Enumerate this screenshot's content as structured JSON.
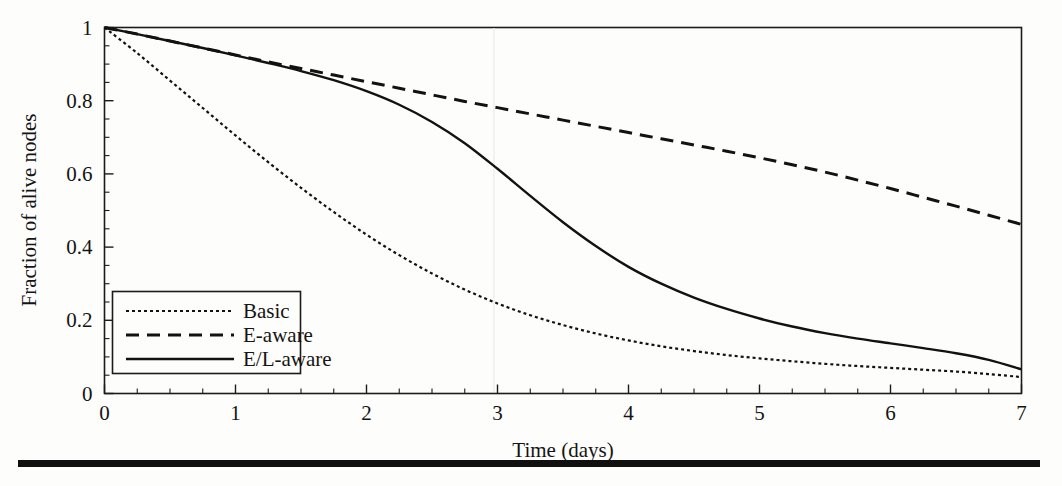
{
  "figure": {
    "name": "fraction-of-alive-nodes-over-time",
    "background_color": "#fdfdfb",
    "ink_color": "#121212"
  },
  "chart_data": {
    "type": "line",
    "title": "",
    "subtitle": "",
    "xlabel": "Time (days)",
    "ylabel": "Fraction of alive nodes",
    "xlim": [
      0,
      7
    ],
    "ylim": [
      0,
      1
    ],
    "x_major_ticks": [
      0,
      1,
      2,
      3,
      4,
      5,
      6,
      7
    ],
    "x_tick_labels": [
      "0",
      "1",
      "2",
      "3",
      "4",
      "5",
      "6",
      "7"
    ],
    "x_minor_step": 0.25,
    "y_major_ticks": [
      0,
      0.2,
      0.4,
      0.6,
      0.8,
      1
    ],
    "y_tick_labels": [
      "0",
      "0.2",
      "0.4",
      "0.6",
      "0.8",
      "1"
    ],
    "y_minor_step": 0.05,
    "grid": false,
    "legend_position": "lower-left",
    "annotations": [],
    "x": [
      0,
      0.25,
      0.5,
      0.75,
      1,
      1.25,
      1.5,
      1.75,
      2,
      2.25,
      2.5,
      2.75,
      3,
      3.25,
      3.5,
      3.75,
      4,
      4.25,
      4.5,
      4.75,
      5,
      5.25,
      5.5,
      5.75,
      6,
      6.25,
      6.5,
      6.75,
      7
    ],
    "series": [
      {
        "name": "Basic",
        "style": "dotted",
        "dash_pattern": "3,3",
        "line_width": 2.2,
        "color": "#121212",
        "values": [
          1.0,
          0.93,
          0.855,
          0.78,
          0.705,
          0.632,
          0.562,
          0.496,
          0.434,
          0.378,
          0.328,
          0.284,
          0.246,
          0.214,
          0.187,
          0.164,
          0.145,
          0.129,
          0.116,
          0.105,
          0.096,
          0.088,
          0.081,
          0.075,
          0.07,
          0.065,
          0.06,
          0.053,
          0.045
        ]
      },
      {
        "name": "E-aware",
        "style": "dashed",
        "dash_pattern": "13,8",
        "line_width": 3.0,
        "color": "#121212",
        "values": [
          1.0,
          0.982,
          0.963,
          0.944,
          0.925,
          0.906,
          0.888,
          0.87,
          0.852,
          0.834,
          0.816,
          0.798,
          0.781,
          0.764,
          0.747,
          0.73,
          0.713,
          0.696,
          0.679,
          0.662,
          0.644,
          0.625,
          0.605,
          0.583,
          0.56,
          0.536,
          0.512,
          0.487,
          0.462
        ]
      },
      {
        "name": "E/L-aware",
        "style": "solid",
        "dash_pattern": "none",
        "line_width": 2.4,
        "color": "#121212",
        "values": [
          1.0,
          0.982,
          0.963,
          0.944,
          0.924,
          0.903,
          0.881,
          0.856,
          0.826,
          0.789,
          0.742,
          0.684,
          0.614,
          0.54,
          0.468,
          0.403,
          0.346,
          0.3,
          0.262,
          0.231,
          0.205,
          0.183,
          0.165,
          0.15,
          0.137,
          0.124,
          0.11,
          0.092,
          0.066
        ]
      }
    ]
  },
  "legend": {
    "entries": [
      {
        "label": "Basic",
        "style": "dotted"
      },
      {
        "label": "E-aware",
        "style": "dashed"
      },
      {
        "label": "E/L-aware",
        "style": "solid"
      }
    ]
  }
}
